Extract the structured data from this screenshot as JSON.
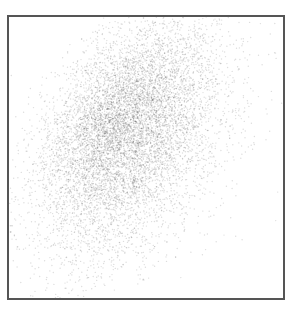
{
  "chart_data": {
    "type": "scatter",
    "title": "",
    "xlabel": "",
    "ylabel": "",
    "xticks": [],
    "yticks": [],
    "grid": false,
    "legend": null,
    "frame": {
      "visible": true,
      "color": "#555555"
    },
    "point_color": "#2a2a2a",
    "density_model": {
      "plot_width_px": 274,
      "plot_height_px": 281,
      "components": [
        {
          "cx": 0.4,
          "cy": 0.34,
          "sx": 0.12,
          "sy": 0.16,
          "shear": 0.45,
          "weight": 0.5
        },
        {
          "cx": 0.44,
          "cy": 0.55,
          "sx": 0.16,
          "sy": 0.2,
          "shear": 0.45,
          "weight": 0.35
        },
        {
          "cx": 0.52,
          "cy": 0.4,
          "sx": 0.13,
          "sy": 0.18,
          "shear": 0.45,
          "weight": 0.15
        }
      ],
      "n_points": 9000,
      "point_radius": 0.7,
      "point_opacity": 0.16
    }
  }
}
